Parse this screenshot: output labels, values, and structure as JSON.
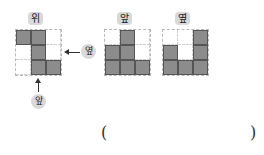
{
  "views": [
    {
      "key": "top",
      "label": "위",
      "cells": [
        1,
        1,
        0,
        0,
        1,
        0,
        0,
        1,
        1
      ]
    },
    {
      "key": "front",
      "label": "앞",
      "cells": [
        0,
        1,
        0,
        1,
        1,
        0,
        1,
        1,
        1
      ]
    },
    {
      "key": "side",
      "label": "옆",
      "cells": [
        0,
        0,
        1,
        1,
        0,
        1,
        1,
        1,
        1
      ]
    }
  ],
  "direction_labels": {
    "side": "옆",
    "front": "앞"
  },
  "answer": {
    "open": "(",
    "close": ")",
    "value": ""
  },
  "colors": {
    "filled": "#8c8c8c",
    "pill": "#d9d9d9"
  }
}
